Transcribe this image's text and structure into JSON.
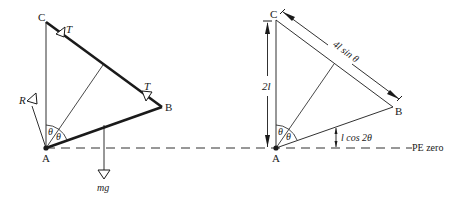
{
  "figure": {
    "left_diagram": {
      "points": {
        "A": "A",
        "B": "B",
        "C": "C"
      },
      "forces": {
        "tension_1": "T",
        "tension_2": "T",
        "reaction": "R",
        "weight": "mg"
      },
      "angles": {
        "theta_1": "θ",
        "theta_2": "θ"
      }
    },
    "right_diagram": {
      "points": {
        "A": "A",
        "B": "B",
        "C": "C"
      },
      "dimensions": {
        "vertical_height": "2l",
        "string_length": "4l sin θ",
        "center_height": "l cos 2θ"
      },
      "angles": {
        "theta_1": "θ",
        "theta_2": "θ"
      },
      "reference_line_label": "PE zero"
    },
    "colors": {
      "ink": "#1a1a1a",
      "background": "#ffffff"
    }
  }
}
